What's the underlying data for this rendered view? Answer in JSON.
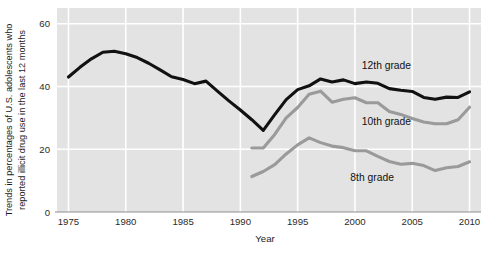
{
  "figure": {
    "plot_bg": "#e3e3e3",
    "grid_color": "#ffffff",
    "axis_color": "#8f8f8f",
    "ylabel_line1": "Trends in percentages of U.S. adolescents who",
    "ylabel_line2": "reported illicit drug use in the last 12 months"
  },
  "chart_data": {
    "type": "line",
    "title": "",
    "xlabel": "Year",
    "ylabel": "Trends in percentages of U.S. adolescents who reported illicit drug use in the last 12 months",
    "xlim": [
      1974,
      2011
    ],
    "ylim": [
      0,
      65
    ],
    "xticks": [
      1975,
      1980,
      1985,
      1990,
      1995,
      2000,
      2005,
      2010
    ],
    "yticks": [
      0,
      20,
      40,
      60
    ],
    "xtick_labels": [
      "1975",
      "1980",
      "1985",
      "1990",
      "1995",
      "2000",
      "2005",
      "2010"
    ],
    "ytick_labels": [
      "0",
      "20",
      "40",
      "60"
    ],
    "grid": "horizontal-and-vertical",
    "legend_position": "inline-right",
    "series": [
      {
        "name": "12th grade",
        "label": "12th grade",
        "color": "#111111",
        "width": 3.1,
        "label_x": 2000.6,
        "label_y": 45.7,
        "x": [
          1975,
          1976,
          1977,
          1978,
          1979,
          1980,
          1981,
          1982,
          1983,
          1984,
          1985,
          1986,
          1987,
          1988,
          1989,
          1990,
          1991,
          1992,
          1993,
          1994,
          1995,
          1996,
          1997,
          1998,
          1999,
          2000,
          2001,
          2002,
          2003,
          2004,
          2005,
          2006,
          2007,
          2008,
          2009,
          2010
        ],
        "y": [
          43.0,
          46.1,
          48.8,
          50.9,
          51.2,
          50.4,
          49.2,
          47.4,
          45.3,
          43.1,
          42.2,
          40.9,
          41.7,
          38.5,
          35.4,
          32.5,
          29.4,
          26.0,
          31.0,
          35.8,
          39.0,
          40.2,
          42.4,
          41.4,
          42.1,
          40.9,
          41.4,
          41.0,
          39.3,
          38.8,
          38.4,
          36.5,
          35.9,
          36.6,
          36.5,
          38.3
        ]
      },
      {
        "name": "10th grade",
        "label": "10th grade",
        "color": "#9a9a9a",
        "width": 3.1,
        "label_x": 2000.6,
        "label_y": 27.6,
        "x": [
          1991,
          1992,
          1993,
          1994,
          1995,
          1996,
          1997,
          1998,
          1999,
          2000,
          2001,
          2002,
          2003,
          2004,
          2005,
          2006,
          2007,
          2008,
          2009,
          2010
        ],
        "y": [
          20.4,
          20.4,
          24.7,
          30.0,
          33.3,
          37.5,
          38.5,
          35.0,
          35.9,
          36.4,
          34.8,
          34.8,
          32.0,
          31.1,
          29.8,
          28.7,
          28.1,
          28.1,
          29.4,
          33.4
        ]
      },
      {
        "name": "8th grade",
        "label": "8th grade",
        "color": "#9a9a9a",
        "width": 3.1,
        "label_x": 1999.6,
        "label_y": 9.8,
        "x": [
          1991,
          1992,
          1993,
          1994,
          1995,
          1996,
          1997,
          1998,
          1999,
          2000,
          2001,
          2002,
          2003,
          2004,
          2005,
          2006,
          2007,
          2008,
          2009,
          2010
        ],
        "y": [
          11.3,
          12.9,
          15.1,
          18.5,
          21.4,
          23.6,
          22.1,
          21.0,
          20.5,
          19.5,
          19.5,
          17.7,
          16.1,
          15.2,
          15.5,
          14.8,
          13.2,
          14.1,
          14.5,
          16.0
        ]
      }
    ]
  }
}
